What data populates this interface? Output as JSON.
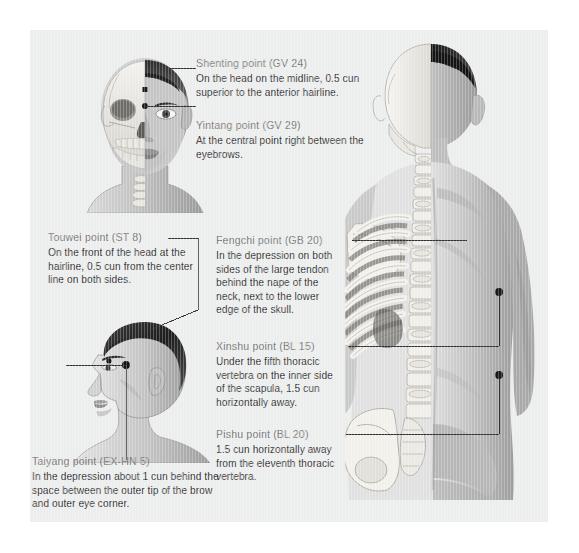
{
  "figure": {
    "background_color": "#eceded",
    "page_color": "#ffffff",
    "title_color": "#7d7d7d",
    "body_color": "#3a3a3a",
    "leader_color": "#2e2e2e",
    "marker_color": "#1a1a1a"
  },
  "illustrations": [
    {
      "name": "front-head-skull-split",
      "description": "Anterior view of a male head, split down the midline: left half shows the skull with orbit, zygomatic arch, maxilla and mandible teeth plus cervical vertebrae at the throat; right half shows skin, eyebrow, eye, ear, nose and lips."
    },
    {
      "name": "profile-head",
      "description": "Left lateral profile view of a male head with short dark hair, showing ear, eyebrow, nose, lips, chin, jawline, neck and shoulder."
    },
    {
      "name": "back-torso-spine-split",
      "description": "Posterior view of a male torso split vertically: left half shows skeleton with cranium, cervical and thoracic vertebrae, scapula, rib cage, lumbar vertebrae and pelvis; right half shows skin with neck, shoulder, back muscles, buttocks and arm."
    }
  ],
  "callouts": [
    {
      "id": "shenting",
      "title": "Shenting point (GV 24)",
      "body": [
        "On the head on the midline, 0.5 cun",
        "superior to the anterior hairline."
      ]
    },
    {
      "id": "yintang",
      "title": "Yintang point (GV 29)",
      "body": [
        "At the central point right between the",
        "eyebrows."
      ]
    },
    {
      "id": "touwei",
      "title": "Touwei point (ST 8)",
      "body": [
        "On the front of the head at the",
        "hairline, 0.5 cun from the center",
        "line on both sides."
      ]
    },
    {
      "id": "taiyang",
      "title": "Taiyang point (EX-HN 5)",
      "body": [
        "In the depression about 1 cun behind the",
        "space between the outer tip of the brow",
        "and outer eye corner."
      ]
    },
    {
      "id": "fengchi",
      "title": "Fengchi point (GB 20)",
      "body": [
        "In the depression on both",
        "sides of the large tendon",
        "behind the nape of the",
        "neck, next to the lower",
        "edge of the skull."
      ]
    },
    {
      "id": "xinshu",
      "title": "Xinshu point (BL 15)",
      "body": [
        "Under the fifth thoracic",
        "vertebra on the inner side",
        "of the scapula, 1.5 cun",
        "horizontally away."
      ]
    },
    {
      "id": "pishu",
      "title": "Pishu point (BL 20)",
      "body": [
        "1.5 cun horizontally  away",
        "from the eleventh thoracic",
        "vertebra."
      ]
    }
  ]
}
